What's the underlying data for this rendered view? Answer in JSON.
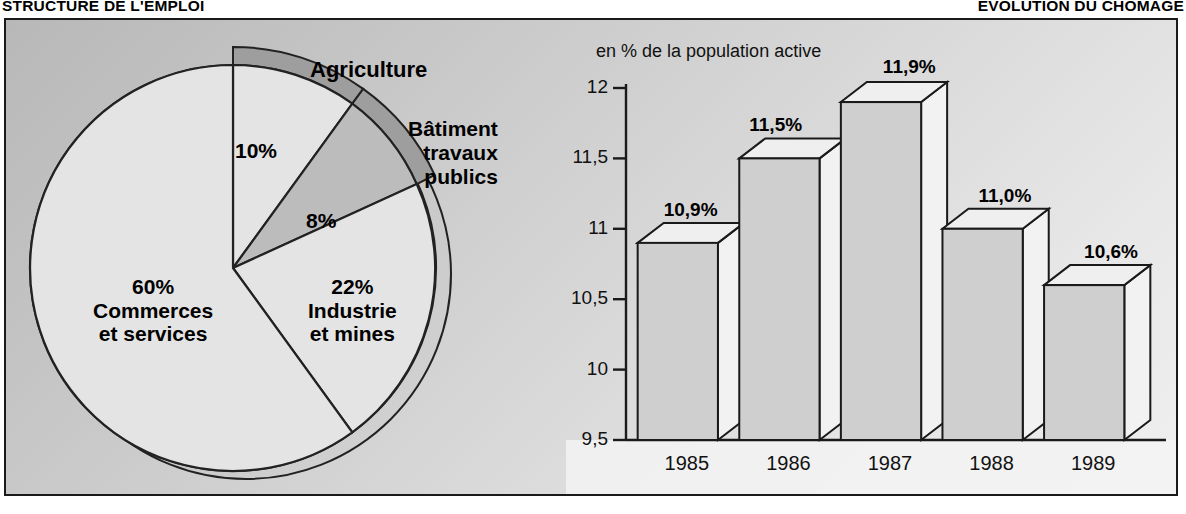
{
  "titles": {
    "left": "STRUCTURE DE  L'EMPLOI",
    "right": "EVOLUTION DU CHOMAGE"
  },
  "pie_panel": {
    "labels": {
      "agriculture": "Agriculture",
      "btp_line1": "Bâtiment",
      "btp_line2": "travaux",
      "btp_line3": "publics",
      "pct_agriculture": "10%",
      "pct_btp": "8%",
      "commerce_pct": "60%",
      "commerce_line1": "Commerces",
      "commerce_line2": "et services",
      "industrie_pct": "22%",
      "industrie_line1": "Industrie",
      "industrie_line2": "et mines"
    }
  },
  "bar_panel": {
    "axis_note": "en % de la population active"
  },
  "colors": {
    "frame": "#1a1a1a",
    "pie_light": "#e2e2e2",
    "pie_mid": "#bdbdbd",
    "pie_dark": "#9a9a9a",
    "bar_face": "#cfcfcf",
    "bar_top": "#efefef",
    "bar_side": "#f2f2f2",
    "background_light": "#efefef",
    "background_dark": "#b8b8b8"
  },
  "chart_data": [
    {
      "type": "pie",
      "title": "STRUCTURE DE  L'EMPLOI",
      "categories": [
        "Agriculture",
        "Bâtiment travaux publics",
        "Industrie et mines",
        "Commerces et services"
      ],
      "values": [
        10,
        8,
        22,
        60
      ],
      "value_labels": [
        "10%",
        "8%",
        "22%",
        "60%"
      ],
      "unit": "%",
      "legend": "inline",
      "grid": false
    },
    {
      "type": "bar",
      "title": "EVOLUTION DU CHOMAGE",
      "subtitle": "en % de la population active",
      "categories": [
        "1985",
        "1986",
        "1987",
        "1988",
        "1989"
      ],
      "values": [
        10.9,
        11.5,
        11.9,
        11.0,
        10.6
      ],
      "value_labels": [
        "10,9%",
        "11,5%",
        "11,9%",
        "11,0%",
        "10,6%"
      ],
      "xlabel": "",
      "ylabel": "en % de la population active",
      "ylim": [
        9.5,
        12
      ],
      "yticks": [
        9.5,
        10,
        10.5,
        11,
        11.5,
        12
      ],
      "ytick_labels": [
        "9,5",
        "10",
        "10,5",
        "11",
        "11,5",
        "12"
      ],
      "grid": false,
      "legend": "none"
    }
  ]
}
